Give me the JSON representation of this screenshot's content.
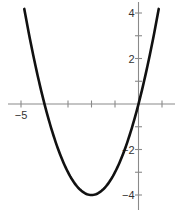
{
  "chart_data": {
    "type": "line",
    "title": "",
    "xlabel": "",
    "ylabel": "",
    "function": "y = x^2 + 4x = (x+2)^2 - 4",
    "xlim": [
      -5.3,
      1.6
    ],
    "ylim": [
      -4.6,
      4.5
    ],
    "grid": false,
    "x_ticks": [
      -5,
      -4,
      -3,
      -2,
      -1,
      0,
      1
    ],
    "y_ticks": [
      -4,
      -3,
      -2,
      -1,
      1,
      2,
      3,
      4
    ],
    "x_tick_labels": [
      {
        "value": -5,
        "label": "−5"
      }
    ],
    "y_tick_labels": [
      {
        "value": 4,
        "label": "4"
      },
      {
        "value": 2,
        "label": "2"
      },
      {
        "value": -2,
        "label": "−2"
      },
      {
        "value": -4,
        "label": "−4"
      }
    ],
    "series": [
      {
        "name": "parabola",
        "color": "#111111",
        "x": [
          -4.86,
          -4.5,
          -4,
          -3.5,
          -3,
          -2.5,
          -2,
          -1.5,
          -1,
          -0.5,
          0,
          0.5,
          0.86
        ],
        "y": [
          4.41,
          2.25,
          0,
          -1.75,
          -3,
          -3.75,
          -4,
          -3.75,
          -3,
          -1.75,
          0,
          2.25,
          4.18
        ]
      }
    ],
    "key_points": {
      "vertex": [
        -2,
        -4
      ],
      "x_intercepts": [
        -4,
        0
      ],
      "y_intercept": 0
    }
  }
}
